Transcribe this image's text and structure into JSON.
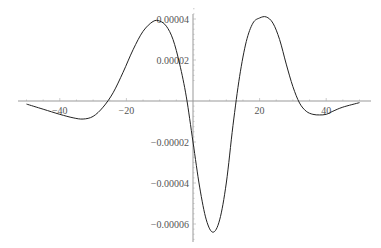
{
  "chart_data": {
    "type": "line",
    "title": "",
    "xlabel": "",
    "ylabel": "",
    "xlim": [
      -50,
      50
    ],
    "ylim": [
      -7e-05,
      4.5e-05
    ],
    "grid": false,
    "legend": null,
    "x_ticks": [
      -40,
      -20,
      20,
      40
    ],
    "x_tick_labels": [
      "-40",
      "-20",
      "20",
      "40"
    ],
    "y_ticks": [
      4e-05,
      2e-05,
      -2e-05,
      -4e-05,
      -6e-05
    ],
    "y_tick_labels": [
      "0.00004",
      "0.00002",
      "-0.00002",
      "-0.00004",
      "-0.00006"
    ],
    "series": [
      {
        "name": "f(x)",
        "color": "#222222",
        "x": [
          -50,
          -45,
          -40,
          -36,
          -33,
          -30,
          -27,
          -24,
          -21,
          -18,
          -15,
          -12,
          -10,
          -8,
          -6,
          -4,
          -2,
          0,
          2,
          4,
          6,
          8,
          10,
          12,
          14,
          16,
          18,
          20,
          22,
          24,
          26,
          28,
          30,
          32,
          34,
          36,
          38,
          40,
          42,
          45,
          50
        ],
        "y": [
          -1.5e-06,
          -4e-06,
          -6.5e-06,
          -8.2e-06,
          -8.8e-06,
          -7.5e-06,
          -3e-06,
          4e-06,
          1.4e-05,
          2.5e-05,
          3.4e-05,
          3.88e-05,
          3.9e-05,
          3.65e-05,
          3e-05,
          1.8e-05,
          2e-06,
          -2e-05,
          -4.2e-05,
          -5.8e-05,
          -6.4e-05,
          -5.8e-05,
          -4e-05,
          -1.2e-05,
          1.2e-05,
          2.9e-05,
          3.8e-05,
          4.05e-05,
          4.1e-05,
          3.8e-05,
          3e-05,
          1.8e-05,
          7e-06,
          -1e-06,
          -5e-06,
          -6.5e-06,
          -6.8e-06,
          -6.5e-06,
          -5e-06,
          -3e-06,
          -8e-07
        ]
      }
    ]
  }
}
